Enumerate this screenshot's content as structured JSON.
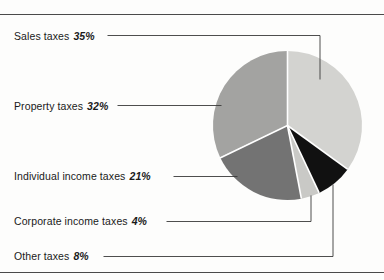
{
  "figure": {
    "background_color": "#fdfdfc",
    "rule_color": "#4a4a4a",
    "divider_color": "#ffffff"
  },
  "chart_data": {
    "type": "pie",
    "title": "",
    "xlabel": "",
    "ylabel": "",
    "legend_position": "callout-labels-left",
    "grid": false,
    "start_angle_deg": 0,
    "direction": "clockwise",
    "categories": [
      "Sales taxes",
      "Other taxes",
      "Corporate income taxes",
      "Individual income taxes",
      "Property taxes"
    ],
    "values": [
      35,
      8,
      4,
      21,
      32
    ],
    "value_unit": "%",
    "slices": [
      {
        "label": "Sales taxes",
        "value": 35,
        "value_text": "35%",
        "color": "#d3d3d0",
        "start_deg": 0,
        "end_deg": 126
      },
      {
        "label": "Other taxes",
        "value": 8,
        "value_text": "8%",
        "color": "#111111",
        "start_deg": 126,
        "end_deg": 154.8
      },
      {
        "label": "Corporate income taxes",
        "value": 4,
        "value_text": "4%",
        "color": "#c9c9c6",
        "start_deg": 154.8,
        "end_deg": 169.2
      },
      {
        "label": "Individual income taxes",
        "value": 21,
        "value_text": "21%",
        "color": "#737373",
        "start_deg": 169.2,
        "end_deg": 244.8
      },
      {
        "label": "Property taxes",
        "value": 32,
        "value_text": "32%",
        "color": "#a3a3a1",
        "start_deg": 244.8,
        "end_deg": 360
      }
    ]
  },
  "labels": {
    "sales": {
      "name": "Sales taxes",
      "pct": "35%"
    },
    "property": {
      "name": "Property taxes",
      "pct": "32%"
    },
    "individual": {
      "name": "Individual income taxes",
      "pct": "21%"
    },
    "corporate": {
      "name": "Corporate income taxes",
      "pct": "4%"
    },
    "other": {
      "name": "Other taxes",
      "pct": "8%"
    }
  }
}
